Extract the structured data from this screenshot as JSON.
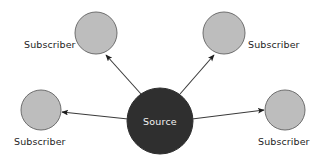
{
  "diagram": {
    "background_color": "#ffffff",
    "source": {
      "label": "Source",
      "label_color": "#f2f2f2",
      "fill": "#2f2f2f",
      "stroke": "#2f2f2f",
      "cx": 160,
      "cy": 121,
      "r": 33
    },
    "subscribers": [
      {
        "id": "top-left",
        "label": "Subscriber",
        "fill": "#bdbdbd",
        "stroke": "#6e6e6e",
        "cx": 96,
        "cy": 33,
        "r": 21,
        "label_x": 24,
        "label_y": 48
      },
      {
        "id": "top-right",
        "label": "Subscriber",
        "fill": "#bdbdbd",
        "stroke": "#6e6e6e",
        "cx": 224,
        "cy": 33,
        "r": 21,
        "label_x": 248,
        "label_y": 48
      },
      {
        "id": "bottom-left",
        "label": "Subscriber",
        "fill": "#bdbdbd",
        "stroke": "#6e6e6e",
        "cx": 41,
        "cy": 110,
        "r": 20,
        "label_x": 14,
        "label_y": 145
      },
      {
        "id": "bottom-right",
        "label": "Subscriber",
        "fill": "#bdbdbd",
        "stroke": "#6e6e6e",
        "cx": 285,
        "cy": 110,
        "r": 20,
        "label_x": 258,
        "label_y": 145
      }
    ],
    "arrows": [
      {
        "id": "source-to-top-left",
        "from": "source",
        "to": "top-left",
        "x1": 141,
        "y1": 94,
        "x2": 106,
        "y2": 55,
        "color": "#3a3a3a"
      },
      {
        "id": "source-to-top-right",
        "from": "source",
        "to": "top-right",
        "x1": 180,
        "y1": 94,
        "x2": 214,
        "y2": 55,
        "color": "#3a3a3a"
      },
      {
        "id": "source-to-bottom-left",
        "from": "source",
        "to": "bottom-left",
        "x1": 128,
        "y1": 119,
        "x2": 62,
        "y2": 112,
        "color": "#3a3a3a"
      },
      {
        "id": "source-to-bottom-right",
        "from": "source",
        "to": "bottom-right",
        "x1": 192,
        "y1": 119,
        "x2": 264,
        "y2": 110,
        "color": "#3a3a3a"
      }
    ],
    "stroke_width": 1.1,
    "arrowhead_color": "#1d1d1d"
  }
}
